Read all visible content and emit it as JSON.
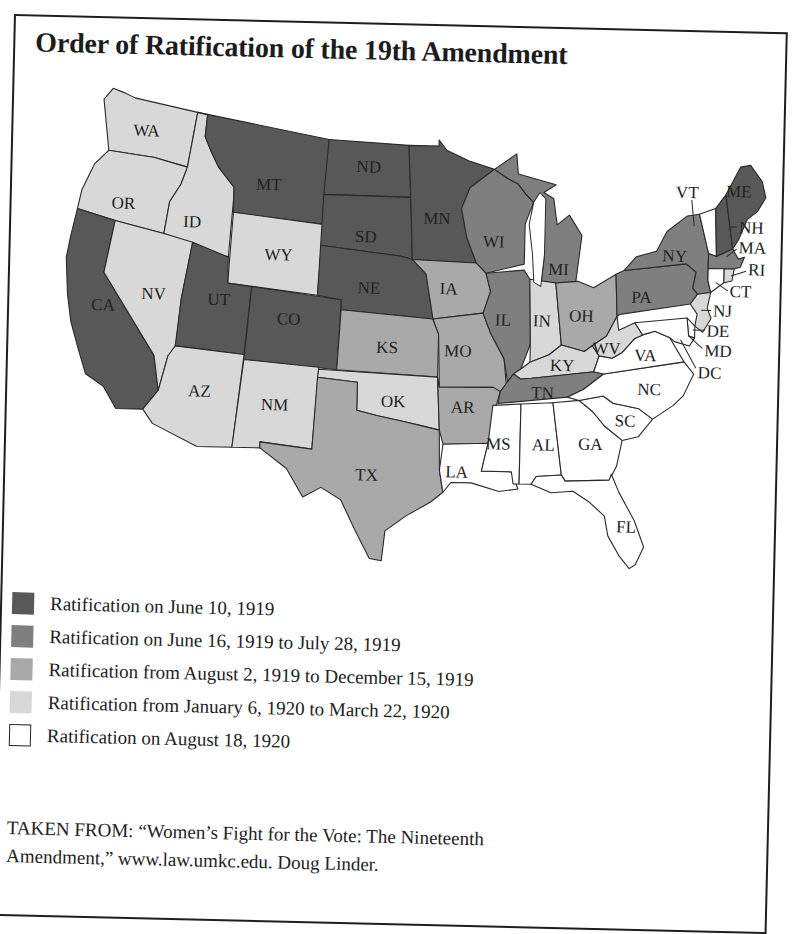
{
  "title": "Order of Ratification of the 19th Amendment",
  "legend": {
    "items": [
      {
        "key": "g1",
        "label": "Ratification on June 10, 1919",
        "color": "#585858"
      },
      {
        "key": "g2",
        "label": "Ratification on June 16, 1919 to July 28, 1919",
        "color": "#7f7f7f"
      },
      {
        "key": "g3",
        "label": "Ratification from August 2, 1919 to December 15, 1919",
        "color": "#a9a9a9"
      },
      {
        "key": "g4",
        "label": "Ratification from January 6, 1920 to March 22, 1920",
        "color": "#d8d8d8"
      },
      {
        "key": "g5",
        "label": "Ratification on August 18, 1920",
        "color": "#ffffff"
      }
    ]
  },
  "source": {
    "line1": "TAKEN FROM: “Women’s Fight for the Vote: The Nineteenth",
    "line2": "Amendment,” www.law.umkc.edu. Doug Linder."
  },
  "map": {
    "states": {
      "WA": {
        "label": "WA",
        "group": "g4"
      },
      "OR": {
        "label": "OR",
        "group": "g4"
      },
      "CA": {
        "label": "CA",
        "group": "g1"
      },
      "ID": {
        "label": "ID",
        "group": "g4"
      },
      "NV": {
        "label": "NV",
        "group": "g4"
      },
      "MT": {
        "label": "MT",
        "group": "g1"
      },
      "WY": {
        "label": "WY",
        "group": "g4"
      },
      "UT": {
        "label": "UT",
        "group": "g1"
      },
      "CO": {
        "label": "CO",
        "group": "g1"
      },
      "AZ": {
        "label": "AZ",
        "group": "g4"
      },
      "NM": {
        "label": "NM",
        "group": "g4"
      },
      "ND": {
        "label": "ND",
        "group": "g1"
      },
      "SD": {
        "label": "SD",
        "group": "g1"
      },
      "NE": {
        "label": "NE",
        "group": "g1"
      },
      "KS": {
        "label": "KS",
        "group": "g3"
      },
      "OK": {
        "label": "OK",
        "group": "g4"
      },
      "TX": {
        "label": "TX",
        "group": "g3"
      },
      "MN": {
        "label": "MN",
        "group": "g1"
      },
      "IA": {
        "label": "IA",
        "group": "g3"
      },
      "MO": {
        "label": "MO",
        "group": "g3"
      },
      "AR": {
        "label": "AR",
        "group": "g3"
      },
      "LA": {
        "label": "LA",
        "group": "g5"
      },
      "WI": {
        "label": "WI",
        "group": "g2"
      },
      "IL": {
        "label": "IL",
        "group": "g2"
      },
      "MI": {
        "label": "MI",
        "group": "g2"
      },
      "IN": {
        "label": "IN",
        "group": "g4"
      },
      "OH": {
        "label": "OH",
        "group": "g3"
      },
      "KY": {
        "label": "KY",
        "group": "g4"
      },
      "TN": {
        "label": "TN",
        "group": "g2"
      },
      "MS": {
        "label": "MS",
        "group": "g5"
      },
      "AL": {
        "label": "AL",
        "group": "g5"
      },
      "GA": {
        "label": "GA",
        "group": "g5"
      },
      "FL": {
        "label": "FL",
        "group": "g5"
      },
      "SC": {
        "label": "SC",
        "group": "g5"
      },
      "NC": {
        "label": "NC",
        "group": "g5"
      },
      "VA": {
        "label": "VA",
        "group": "g5"
      },
      "WV": {
        "label": "WV",
        "group": "g4"
      },
      "PA": {
        "label": "PA",
        "group": "g2"
      },
      "NY": {
        "label": "NY",
        "group": "g2"
      },
      "NJ": {
        "label": "NJ",
        "group": "g4"
      },
      "DE": {
        "label": "DE",
        "group": "g5"
      },
      "MD": {
        "label": "MD",
        "group": "g5"
      },
      "DC": {
        "label": "DC",
        "group": "g5"
      },
      "VT": {
        "label": "VT",
        "group": "g5"
      },
      "NH": {
        "label": "NH",
        "group": "g1"
      },
      "ME": {
        "label": "ME",
        "group": "g1"
      },
      "MA": {
        "label": "MA",
        "group": "g2"
      },
      "RI": {
        "label": "RI",
        "group": "g4"
      },
      "CT": {
        "label": "CT",
        "group": "g5"
      }
    }
  }
}
